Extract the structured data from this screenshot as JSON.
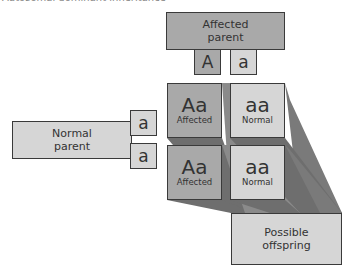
{
  "title": "Autosomal dominant inheritance",
  "affected_parent": {
    "label_line1": "Affected",
    "label_line2": "parent",
    "alleles": [
      "A",
      "a"
    ]
  },
  "normal_parent": {
    "label_line1": "Normal",
    "label_line2": "parent",
    "alleles": [
      "a",
      "a"
    ]
  },
  "offspring": [
    {
      "genotype": "Aa",
      "phenotype": "Affected"
    },
    {
      "genotype": "aa",
      "phenotype": "Normal"
    },
    {
      "genotype": "Aa",
      "phenotype": "Affected"
    },
    {
      "genotype": "aa",
      "phenotype": "Normal"
    }
  ],
  "possible_offspring": {
    "label_line1": "Possible",
    "label_line2": "offspring"
  },
  "colors": {
    "dark_fill": "#a9a9a9",
    "light_fill": "#d6d6d6",
    "shadow": "#6e6e6e",
    "border": "#3a3a3a"
  }
}
